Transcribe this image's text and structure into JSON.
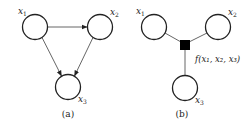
{
  "panels": [
    {
      "id": "a",
      "caption": "(a)",
      "type": "directed-graph",
      "nodes": [
        {
          "id": "x1",
          "label": "x",
          "sub": "1",
          "cx": 35,
          "cy": 27,
          "r": 12.5
        },
        {
          "id": "x2",
          "label": "x",
          "sub": "2",
          "cx": 100,
          "cy": 27,
          "r": 12.5
        },
        {
          "id": "x3",
          "label": "x",
          "sub": "3",
          "cx": 68,
          "cy": 87,
          "r": 12.5
        }
      ],
      "edges": [
        {
          "from": "x1",
          "to": "x2",
          "directed": true
        },
        {
          "from": "x1",
          "to": "x3",
          "directed": true
        },
        {
          "from": "x2",
          "to": "x3",
          "directed": true
        }
      ]
    },
    {
      "id": "b",
      "caption": "(b)",
      "type": "factor-graph",
      "nodes": [
        {
          "id": "x1",
          "label": "x",
          "sub": "1",
          "cx": 154,
          "cy": 27,
          "r": 12.5
        },
        {
          "id": "x2",
          "label": "x",
          "sub": "2",
          "cx": 218,
          "cy": 27,
          "r": 12.5
        },
        {
          "id": "x3",
          "label": "x",
          "sub": "3",
          "cx": 185,
          "cy": 88,
          "r": 12.5
        }
      ],
      "factor": {
        "id": "f",
        "label": "f(x₁, x₂, x₃)",
        "cx": 185,
        "cy": 45,
        "size": 10,
        "color": "#000000"
      },
      "edges": [
        {
          "from": "x1",
          "to": "f",
          "directed": false
        },
        {
          "from": "x2",
          "to": "f",
          "directed": false
        },
        {
          "from": "f",
          "to": "x3",
          "directed": false
        }
      ]
    }
  ],
  "colors": {
    "node_stroke": "#222222",
    "edge": "#555555",
    "factor_fill": "#000000",
    "background": "#ffffff"
  }
}
